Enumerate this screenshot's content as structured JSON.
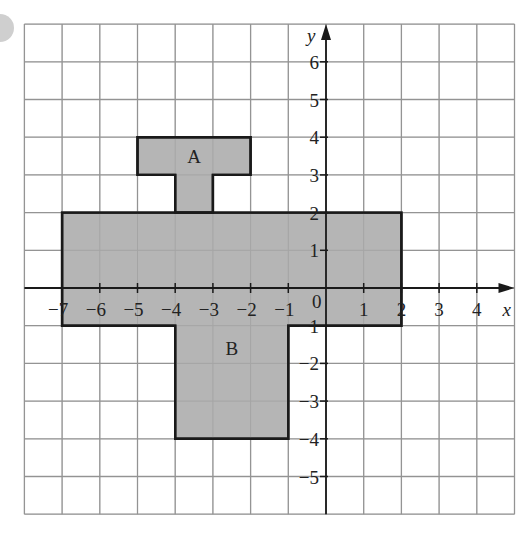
{
  "diagram": {
    "type": "coordinate-grid",
    "grid": {
      "x_min": -8,
      "x_max": 5,
      "y_min": -6,
      "y_max": 7,
      "cell_px": 37.7,
      "origin_px": [
        326,
        288
      ],
      "line_color": "#9a9a9a"
    },
    "axes": {
      "x_label": "x",
      "y_label": "y",
      "origin_label": "0",
      "x_ticks": [
        -7,
        -6,
        -5,
        -4,
        -3,
        -2,
        -1,
        1,
        2,
        3,
        4
      ],
      "y_ticks": [
        6,
        5,
        4,
        3,
        2,
        1,
        -1,
        -2,
        -3,
        -4,
        -5
      ]
    },
    "shapes": [
      {
        "name": "A",
        "fill": "#b5b5b5",
        "stroke": "#1a1a1a",
        "vertices": [
          [
            -5,
            4
          ],
          [
            -2,
            4
          ],
          [
            -2,
            3
          ],
          [
            -3,
            3
          ],
          [
            -3,
            2
          ],
          [
            -4,
            2
          ],
          [
            -4,
            3
          ],
          [
            -5,
            3
          ]
        ],
        "label_pos": [
          -3.5,
          3.5
        ]
      },
      {
        "name": "B",
        "fill": "#b5b5b5",
        "stroke": "#1a1a1a",
        "vertices": [
          [
            -7,
            2
          ],
          [
            2,
            2
          ],
          [
            2,
            -1
          ],
          [
            -1,
            -1
          ],
          [
            -1,
            -4
          ],
          [
            -4,
            -4
          ],
          [
            -4,
            -1
          ],
          [
            -7,
            -1
          ]
        ],
        "label_pos": [
          -2.5,
          -1.6
        ]
      }
    ]
  }
}
